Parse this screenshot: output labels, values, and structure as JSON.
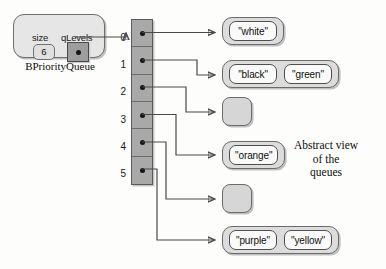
{
  "diagram": {
    "abstract_caption_line1": "Abstract view",
    "abstract_caption_line2": "of the",
    "abstract_caption_line3": "queues"
  },
  "object": {
    "class_name": "BPriorityQueue",
    "fields": [
      {
        "name": "size",
        "value": "6",
        "kind": "value-cell"
      },
      {
        "name": "qLevels",
        "value": "",
        "kind": "pointer-cell"
      }
    ]
  },
  "array": {
    "name": "qLevels-array",
    "length": 6,
    "indices": [
      "0",
      "1",
      "2",
      "3",
      "4",
      "5"
    ]
  },
  "queues": [
    {
      "index": "0",
      "empty": false,
      "items": [
        "\"white\""
      ]
    },
    {
      "index": "1",
      "empty": false,
      "items": [
        "\"black\"",
        "\"green\""
      ]
    },
    {
      "index": "2",
      "empty": true,
      "items": []
    },
    {
      "index": "3",
      "empty": false,
      "items": [
        "\"orange\""
      ]
    },
    {
      "index": "4",
      "empty": true,
      "items": []
    },
    {
      "index": "5",
      "empty": false,
      "items": [
        "\"purple\"",
        "\"yellow\""
      ]
    }
  ],
  "colors": {
    "array_fill": "#a9a9a9",
    "queue_fill": "#dcdcdc",
    "item_fill": "#fafafa",
    "object_fill": "#e6e6e6",
    "pointer_fill": "#9d9d9d",
    "stroke": "#4a4a4a",
    "background": "#fdfdfc"
  }
}
